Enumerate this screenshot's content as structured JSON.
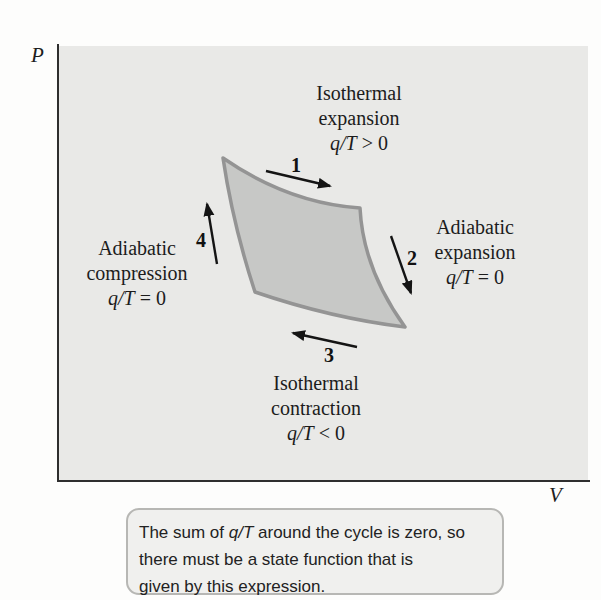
{
  "figure": {
    "axes": {
      "y_label": "P",
      "x_label": "V"
    },
    "steps": {
      "one": "1",
      "two": "2",
      "three": "3",
      "four": "4"
    },
    "labels": {
      "top": {
        "line1": "Isothermal",
        "line2": "expansion",
        "qt": "q/T",
        "relation": " > 0"
      },
      "right": {
        "line1": "Adiabatic",
        "line2": "expansion",
        "qt": "q/T",
        "relation": " = 0"
      },
      "bottom": {
        "line1": "Isothermal",
        "line2": "contraction",
        "qt": "q/T",
        "relation": " < 0"
      },
      "left": {
        "line1": "Adiabatic",
        "line2": "compression",
        "qt": "q/T",
        "relation": " = 0"
      }
    },
    "colors": {
      "plot_bg": "#e9e9e7",
      "cycle_fill": "#c7c8c6",
      "cycle_outline": "#949494",
      "axis": "#2e2e2e",
      "arrow": "#141414",
      "caption_bg": "#f0f0ee",
      "caption_border": "#b7b7b4"
    }
  },
  "caption": {
    "line1_pre": "The sum of ",
    "line1_qt": "q/T",
    "line1_post": " around the cycle is zero, so",
    "line2": "there must be a state function that is",
    "line3": "given by this expression."
  }
}
